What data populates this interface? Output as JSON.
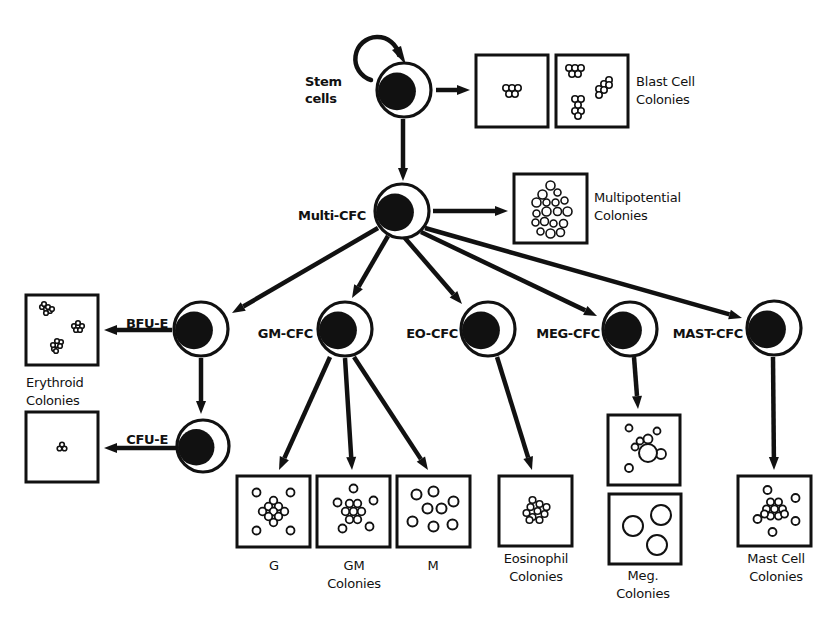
{
  "colors": {
    "ink": "#111111",
    "background": "#ffffff"
  },
  "cells": [
    {
      "id": "stem",
      "label_lines": [
        "Stem",
        "cells"
      ],
      "cx": 404,
      "cy": 90,
      "r": 27,
      "label_x": 305,
      "label_y": 90,
      "label_anchor": "start"
    },
    {
      "id": "multi",
      "label_lines": [
        "Multi-CFC"
      ],
      "cx": 402,
      "cy": 211,
      "r": 27,
      "label_x": 366,
      "label_y": 216,
      "label_anchor": "end"
    },
    {
      "id": "bfu_e",
      "label_lines": [
        "BFU-E"
      ],
      "cx": 201,
      "cy": 329,
      "r": 27,
      "label_x": 168,
      "label_y": 324,
      "label_anchor": "end"
    },
    {
      "id": "cfu_e",
      "label_lines": [
        "CFU-E"
      ],
      "cx": 203,
      "cy": 446,
      "r": 26,
      "label_x": 168,
      "label_y": 440,
      "label_anchor": "end"
    },
    {
      "id": "gm_cfc",
      "label_lines": [
        "GM-CFC"
      ],
      "cx": 345,
      "cy": 329,
      "r": 27,
      "label_x": 313,
      "label_y": 334,
      "label_anchor": "end"
    },
    {
      "id": "eo_cfc",
      "label_lines": [
        "EO-CFC"
      ],
      "cx": 488,
      "cy": 329,
      "r": 27,
      "label_x": 458,
      "label_y": 334,
      "label_anchor": "end"
    },
    {
      "id": "meg_cfc",
      "label_lines": [
        "MEG-CFC"
      ],
      "cx": 630,
      "cy": 329,
      "r": 27,
      "label_x": 600,
      "label_y": 334,
      "label_anchor": "end"
    },
    {
      "id": "mast_cfc",
      "label_lines": [
        "MAST-CFC"
      ],
      "cx": 774,
      "cy": 328,
      "r": 27,
      "label_x": 743,
      "label_y": 334,
      "label_anchor": "end"
    }
  ],
  "colonies": [
    {
      "id": "blast1",
      "x": 476,
      "y": 55,
      "w": 72,
      "h": 72,
      "pattern": "blast_small"
    },
    {
      "id": "blast2",
      "x": 556,
      "y": 55,
      "w": 72,
      "h": 72,
      "pattern": "blast_multi"
    },
    {
      "id": "multipot",
      "x": 514,
      "y": 174,
      "w": 73,
      "h": 69,
      "pattern": "multipotential"
    },
    {
      "id": "erythroid",
      "x": 26,
      "y": 295,
      "w": 72,
      "h": 70,
      "pattern": "erythroid"
    },
    {
      "id": "cfue",
      "x": 26,
      "y": 412,
      "w": 72,
      "h": 70,
      "pattern": "cfue"
    },
    {
      "id": "g",
      "x": 237,
      "y": 476,
      "w": 73,
      "h": 71,
      "pattern": "g"
    },
    {
      "id": "gm",
      "x": 317,
      "y": 476,
      "w": 73,
      "h": 71,
      "pattern": "gm"
    },
    {
      "id": "m",
      "x": 397,
      "y": 476,
      "w": 73,
      "h": 71,
      "pattern": "m"
    },
    {
      "id": "eosin",
      "x": 499,
      "y": 476,
      "w": 73,
      "h": 70,
      "pattern": "eosinophil"
    },
    {
      "id": "meg1",
      "x": 608,
      "y": 415,
      "w": 72,
      "h": 70,
      "pattern": "meg1"
    },
    {
      "id": "meg2",
      "x": 609,
      "y": 494,
      "w": 72,
      "h": 70,
      "pattern": "meg2"
    },
    {
      "id": "mast",
      "x": 738,
      "y": 476,
      "w": 73,
      "h": 70,
      "pattern": "mast"
    }
  ],
  "colony_labels": [
    {
      "id": "blast",
      "lines": [
        "Blast Cell",
        "Colonies"
      ],
      "x": 636,
      "y": 86,
      "anchor": "start"
    },
    {
      "id": "multipot",
      "lines": [
        "Multipotential",
        "Colonies"
      ],
      "x": 594,
      "y": 202,
      "anchor": "start"
    },
    {
      "id": "erythroid",
      "lines": [
        "Erythroid",
        "Colonies"
      ],
      "x": 26,
      "y": 387,
      "anchor": "start"
    },
    {
      "id": "g",
      "lines": [
        "G"
      ],
      "x": 274,
      "y": 570,
      "anchor": "middle"
    },
    {
      "id": "gm",
      "lines": [
        "GM",
        "Colonies"
      ],
      "x": 354,
      "y": 570,
      "anchor": "middle"
    },
    {
      "id": "m",
      "lines": [
        "M"
      ],
      "x": 433,
      "y": 570,
      "anchor": "middle"
    },
    {
      "id": "eosin",
      "lines": [
        "Eosinophil",
        "Colonies"
      ],
      "x": 536,
      "y": 563,
      "anchor": "middle"
    },
    {
      "id": "meg",
      "lines": [
        "Meg.",
        "Colonies"
      ],
      "x": 643,
      "y": 580,
      "anchor": "middle"
    },
    {
      "id": "mast",
      "lines": [
        "Mast Cell",
        "Colonies"
      ],
      "x": 776,
      "y": 563,
      "anchor": "middle"
    }
  ],
  "arrows": [
    {
      "from": "stem",
      "x1": 436,
      "y1": 90,
      "x2": 470,
      "y2": 90
    },
    {
      "from": "stem",
      "x1": 403,
      "y1": 119,
      "x2": 403,
      "y2": 181
    },
    {
      "from": "multi",
      "x1": 433,
      "y1": 211,
      "x2": 508,
      "y2": 211
    },
    {
      "from": "multi",
      "x1": 378,
      "y1": 228,
      "x2": 232,
      "y2": 313
    },
    {
      "from": "multi",
      "x1": 388,
      "y1": 236,
      "x2": 352,
      "y2": 298
    },
    {
      "from": "multi",
      "x1": 404,
      "y1": 237,
      "x2": 462,
      "y2": 304
    },
    {
      "from": "multi",
      "x1": 421,
      "y1": 232,
      "x2": 597,
      "y2": 316
    },
    {
      "from": "multi",
      "x1": 425,
      "y1": 228,
      "x2": 742,
      "y2": 318
    },
    {
      "from": "bfu_e",
      "x1": 172,
      "y1": 330,
      "x2": 104,
      "y2": 330
    },
    {
      "from": "bfu_e",
      "x1": 201,
      "y1": 358,
      "x2": 201,
      "y2": 414
    },
    {
      "from": "cfu_e",
      "x1": 176,
      "y1": 448,
      "x2": 104,
      "y2": 448
    },
    {
      "from": "gm_cfc",
      "x1": 330,
      "y1": 357,
      "x2": 279,
      "y2": 470
    },
    {
      "from": "gm_cfc",
      "x1": 345,
      "y1": 358,
      "x2": 352,
      "y2": 470
    },
    {
      "from": "gm_cfc",
      "x1": 354,
      "y1": 357,
      "x2": 428,
      "y2": 470
    },
    {
      "from": "eo_cfc",
      "x1": 497,
      "y1": 357,
      "x2": 532,
      "y2": 470
    },
    {
      "from": "meg_cfc",
      "x1": 634,
      "y1": 357,
      "x2": 638,
      "y2": 409
    },
    {
      "from": "mast_cfc",
      "x1": 773,
      "y1": 357,
      "x2": 774,
      "y2": 470
    }
  ],
  "self_renewal": {
    "label": "self-renewal loop",
    "cx": 385,
    "cy": 50
  }
}
